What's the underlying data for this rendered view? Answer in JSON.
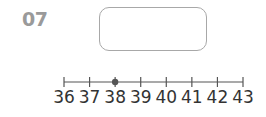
{
  "question": {
    "number": "07"
  },
  "answer_box": {
    "value": ""
  },
  "chart_data": {
    "type": "number-line",
    "ticks": [
      36,
      37,
      38,
      39,
      40,
      41,
      42,
      43
    ],
    "tick_labels": [
      "36",
      "37",
      "38",
      "39",
      "40",
      "41",
      "42",
      "43"
    ],
    "range": [
      36,
      43
    ],
    "marked_points": [
      38
    ],
    "colors": {
      "line": "#555555",
      "point": "#555555",
      "label": "#333333"
    }
  }
}
